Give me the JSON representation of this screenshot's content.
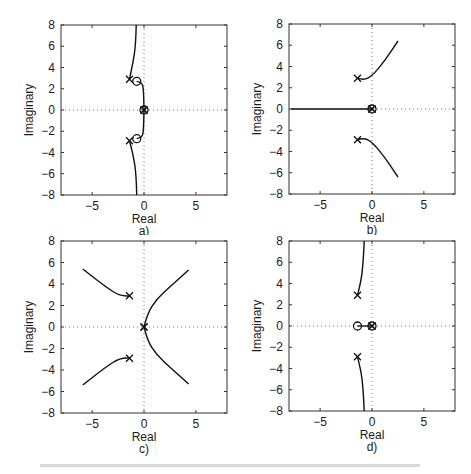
{
  "figure": {
    "subplots": [
      "a)",
      "b)",
      "c)",
      "d)"
    ]
  },
  "chart_data": [
    {
      "id": "a",
      "type": "line",
      "title": "",
      "subplot_label": "a)",
      "xlabel": "Real",
      "ylabel": "Imaginary",
      "xlim": [
        -8,
        8
      ],
      "ylim": [
        -8,
        8
      ],
      "xticks": [
        -5,
        0,
        5
      ],
      "yticks": [
        8,
        6,
        4,
        2,
        0,
        -2,
        -4,
        -6,
        -8
      ],
      "xtick_labels": [
        "−5",
        "0",
        "5"
      ],
      "ytick_labels": [
        "8",
        "6",
        "4",
        "2",
        "0",
        "−2",
        "−4",
        "−6",
        "−8"
      ],
      "grid": false,
      "zero_lines": "dotted",
      "poles": [
        [
          -1.4,
          2.9
        ],
        [
          -1.4,
          -2.9
        ],
        [
          0,
          0
        ],
        [
          0,
          0
        ]
      ],
      "zeros": [
        [
          -0.7,
          2.7
        ],
        [
          -0.7,
          -2.7
        ],
        [
          0,
          0
        ]
      ],
      "branches": [
        [
          [
            -0.75,
            8
          ],
          [
            -0.8,
            6
          ],
          [
            -1.1,
            4.3
          ],
          [
            -1.4,
            2.9
          ]
        ],
        [
          [
            -0.7,
            2.7
          ],
          [
            -0.2,
            2.6
          ],
          [
            -0.05,
            2
          ],
          [
            0,
            0
          ]
        ],
        [
          [
            -0.7,
            -2.7
          ],
          [
            -0.2,
            -2.6
          ],
          [
            -0.05,
            -2
          ],
          [
            0,
            0
          ]
        ],
        [
          [
            -0.7,
            -8
          ],
          [
            -0.75,
            -6
          ],
          [
            -1.05,
            -4.2
          ],
          [
            -1.4,
            -2.9
          ]
        ]
      ]
    },
    {
      "id": "b",
      "type": "line",
      "title": "",
      "subplot_label": "b)",
      "xlabel": "Real",
      "ylabel": "Imaginary",
      "xlim": [
        -8,
        8
      ],
      "ylim": [
        -8,
        8
      ],
      "xticks": [
        -5,
        0,
        5
      ],
      "yticks": [
        8,
        6,
        4,
        2,
        0,
        -2,
        -4,
        -6,
        -8
      ],
      "xtick_labels": [
        "−5",
        "0",
        "5"
      ],
      "ytick_labels": [
        "8",
        "6",
        "4",
        "2",
        "0",
        "−2",
        "−4",
        "−6",
        "−8"
      ],
      "grid": false,
      "zero_lines": "dotted",
      "poles": [
        [
          -1.4,
          2.9
        ],
        [
          -1.4,
          -2.9
        ],
        [
          0,
          0
        ],
        [
          0,
          0
        ]
      ],
      "zeros": [
        [
          0,
          0
        ]
      ],
      "branches": [
        [
          [
            -1.4,
            2.9
          ],
          [
            -0.8,
            2.7
          ],
          [
            0,
            3.1
          ],
          [
            1.2,
            4.5
          ],
          [
            2.5,
            6.4
          ]
        ],
        [
          [
            -1.4,
            -2.9
          ],
          [
            -0.8,
            -2.7
          ],
          [
            0,
            -3.1
          ],
          [
            1.2,
            -4.5
          ],
          [
            2.5,
            -6.4
          ]
        ],
        [
          [
            -7.8,
            0
          ],
          [
            0,
            0
          ]
        ]
      ]
    },
    {
      "id": "c",
      "type": "line",
      "title": "",
      "subplot_label": "c)",
      "xlabel": "Real",
      "ylabel": "Imaginary",
      "xlim": [
        -8,
        8
      ],
      "ylim": [
        -8,
        8
      ],
      "xticks": [
        -5,
        0,
        5
      ],
      "yticks": [
        8,
        6,
        4,
        2,
        0,
        -2,
        -4,
        -6,
        -8
      ],
      "xtick_labels": [
        "−5",
        "0",
        "5"
      ],
      "ytick_labels": [
        "8",
        "6",
        "4",
        "2",
        "0",
        "−2",
        "−4",
        "−6",
        "−8"
      ],
      "grid": false,
      "zero_lines": "dotted",
      "poles": [
        [
          -1.4,
          2.9
        ],
        [
          -1.4,
          -2.9
        ],
        [
          0,
          0
        ],
        [
          0,
          0
        ]
      ],
      "zeros": [],
      "branches": [
        [
          [
            -1.4,
            2.9
          ],
          [
            -2.2,
            2.8
          ],
          [
            -3.8,
            3.8
          ],
          [
            -5.9,
            5.4
          ]
        ],
        [
          [
            -1.4,
            -2.9
          ],
          [
            -2.2,
            -2.8
          ],
          [
            -3.8,
            -3.8
          ],
          [
            -5.9,
            -5.4
          ]
        ],
        [
          [
            0,
            0
          ],
          [
            0.3,
            1.2
          ],
          [
            1.2,
            2.6
          ],
          [
            2.8,
            4
          ],
          [
            4.3,
            5.3
          ]
        ],
        [
          [
            0,
            0
          ],
          [
            0.3,
            -1.2
          ],
          [
            1.2,
            -2.6
          ],
          [
            2.8,
            -4
          ],
          [
            4.3,
            -5.3
          ]
        ]
      ]
    },
    {
      "id": "d",
      "type": "line",
      "title": "",
      "subplot_label": "d)",
      "xlabel": "Real",
      "ylabel": "Imaginary",
      "xlim": [
        -8,
        8
      ],
      "ylim": [
        -8,
        8
      ],
      "xticks": [
        -5,
        0,
        5
      ],
      "yticks": [
        8,
        6,
        4,
        2,
        0,
        -2,
        -4,
        -6,
        -8
      ],
      "xtick_labels": [
        "−5",
        "0",
        "5"
      ],
      "ytick_labels": [
        "8",
        "6",
        "4",
        "2",
        "0",
        "−2",
        "−4",
        "−6",
        "−8"
      ],
      "grid": false,
      "zero_lines": "dotted",
      "poles": [
        [
          -1.4,
          2.9
        ],
        [
          -1.4,
          -2.9
        ],
        [
          0,
          0
        ],
        [
          0,
          0
        ]
      ],
      "zeros": [
        [
          -1.4,
          0
        ],
        [
          0,
          0
        ]
      ],
      "branches": [
        [
          [
            -1.4,
            2.9
          ],
          [
            -1.05,
            4.2
          ],
          [
            -0.85,
            6
          ],
          [
            -0.75,
            8
          ]
        ],
        [
          [
            -1.4,
            -2.9
          ],
          [
            -1.05,
            -4.2
          ],
          [
            -0.85,
            -6
          ],
          [
            -0.75,
            -8
          ]
        ],
        [
          [
            -1.4,
            0
          ],
          [
            0,
            0
          ]
        ]
      ]
    }
  ]
}
